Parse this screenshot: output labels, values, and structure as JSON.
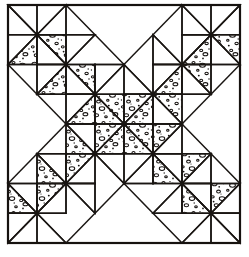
{
  "figure": {
    "kind": "quilt-block-pattern-diagram",
    "grid": {
      "cols": 8,
      "rows": 8
    },
    "canvas": {
      "width": 249,
      "height": 257
    },
    "frame": {
      "x": 8,
      "y": 5,
      "width": 232,
      "height": 238
    },
    "colors": {
      "ink": "#1a1613",
      "frame_ink": "#16120f",
      "background": "#ffffff",
      "plain_fabric": "#ffffff",
      "print_fabric": "#ffffff",
      "print_speckle": "#161210"
    },
    "fabrics": [
      {
        "key": "plain",
        "label": "plain"
      },
      {
        "key": "print",
        "label": "print"
      },
      {
        "key": "empty",
        "label": "background"
      }
    ],
    "motif": "diagonal cross / X of half-square triangles",
    "unit_type": "half-square-triangle",
    "symmetry": "4-fold mirror (horizontal and vertical)",
    "cells": [
      [
        {
          "split": "tlbr",
          "a": "plain",
          "b": "empty"
        },
        {
          "split": "trbl",
          "a": "empty",
          "b": "plain"
        },
        {
          "split": "none",
          "a": "empty",
          "b": "empty"
        },
        {
          "split": "none",
          "a": "empty",
          "b": "empty"
        },
        {
          "split": "none",
          "a": "empty",
          "b": "empty"
        },
        {
          "split": "none",
          "a": "empty",
          "b": "empty"
        },
        {
          "split": "tlbr",
          "a": "empty",
          "b": "plain"
        },
        {
          "split": "trbl",
          "a": "plain",
          "b": "empty"
        }
      ],
      [
        {
          "split": "trbl",
          "a": "plain",
          "b": "print"
        },
        {
          "split": "tlbr",
          "a": "print",
          "b": "plain"
        },
        {
          "split": "trbl",
          "a": "plain",
          "b": "empty"
        },
        {
          "split": "none",
          "a": "empty",
          "b": "empty"
        },
        {
          "split": "none",
          "a": "empty",
          "b": "empty"
        },
        {
          "split": "tlbr",
          "a": "empty",
          "b": "plain"
        },
        {
          "split": "trbl",
          "a": "plain",
          "b": "print"
        },
        {
          "split": "tlbr",
          "a": "print",
          "b": "plain"
        }
      ],
      [
        {
          "split": "none",
          "a": "empty",
          "b": "empty"
        },
        {
          "split": "trbl",
          "a": "plain",
          "b": "print"
        },
        {
          "split": "tlbr",
          "a": "print",
          "b": "plain"
        },
        {
          "split": "trbl",
          "a": "plain",
          "b": "empty"
        },
        {
          "split": "tlbr",
          "a": "empty",
          "b": "plain"
        },
        {
          "split": "trbl",
          "a": "plain",
          "b": "print"
        },
        {
          "split": "tlbr",
          "a": "print",
          "b": "plain"
        },
        {
          "split": "none",
          "a": "empty",
          "b": "empty"
        }
      ],
      [
        {
          "split": "none",
          "a": "empty",
          "b": "empty"
        },
        {
          "split": "none",
          "a": "empty",
          "b": "empty"
        },
        {
          "split": "trbl",
          "a": "plain",
          "b": "print"
        },
        {
          "split": "tlbr",
          "a": "print",
          "b": "print"
        },
        {
          "split": "trbl",
          "a": "print",
          "b": "print"
        },
        {
          "split": "tlbr",
          "a": "print",
          "b": "plain"
        },
        {
          "split": "none",
          "a": "empty",
          "b": "empty"
        },
        {
          "split": "none",
          "a": "empty",
          "b": "empty"
        }
      ],
      [
        {
          "split": "none",
          "a": "empty",
          "b": "empty"
        },
        {
          "split": "none",
          "a": "empty",
          "b": "empty"
        },
        {
          "split": "tlbr",
          "a": "plain",
          "b": "print"
        },
        {
          "split": "trbl",
          "a": "print",
          "b": "print"
        },
        {
          "split": "tlbr",
          "a": "print",
          "b": "print"
        },
        {
          "split": "trbl",
          "a": "print",
          "b": "plain"
        },
        {
          "split": "none",
          "a": "empty",
          "b": "empty"
        },
        {
          "split": "none",
          "a": "empty",
          "b": "empty"
        }
      ],
      [
        {
          "split": "none",
          "a": "empty",
          "b": "empty"
        },
        {
          "split": "tlbr",
          "a": "plain",
          "b": "print"
        },
        {
          "split": "trbl",
          "a": "print",
          "b": "plain"
        },
        {
          "split": "tlbr",
          "a": "plain",
          "b": "empty"
        },
        {
          "split": "trbl",
          "a": "empty",
          "b": "plain"
        },
        {
          "split": "tlbr",
          "a": "plain",
          "b": "print"
        },
        {
          "split": "trbl",
          "a": "print",
          "b": "plain"
        },
        {
          "split": "none",
          "a": "empty",
          "b": "empty"
        }
      ],
      [
        {
          "split": "tlbr",
          "a": "plain",
          "b": "print"
        },
        {
          "split": "trbl",
          "a": "print",
          "b": "plain"
        },
        {
          "split": "tlbr",
          "a": "plain",
          "b": "empty"
        },
        {
          "split": "none",
          "a": "empty",
          "b": "empty"
        },
        {
          "split": "none",
          "a": "empty",
          "b": "empty"
        },
        {
          "split": "trbl",
          "a": "empty",
          "b": "plain"
        },
        {
          "split": "tlbr",
          "a": "plain",
          "b": "print"
        },
        {
          "split": "trbl",
          "a": "print",
          "b": "plain"
        }
      ],
      [
        {
          "split": "trbl",
          "a": "plain",
          "b": "empty"
        },
        {
          "split": "tlbr",
          "a": "empty",
          "b": "plain"
        },
        {
          "split": "none",
          "a": "empty",
          "b": "empty"
        },
        {
          "split": "none",
          "a": "empty",
          "b": "empty"
        },
        {
          "split": "none",
          "a": "empty",
          "b": "empty"
        },
        {
          "split": "none",
          "a": "empty",
          "b": "empty"
        },
        {
          "split": "trbl",
          "a": "empty",
          "b": "plain"
        },
        {
          "split": "tlbr",
          "a": "plain",
          "b": "empty"
        }
      ]
    ]
  }
}
